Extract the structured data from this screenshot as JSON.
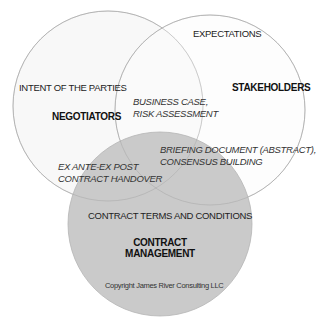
{
  "diagram": {
    "type": "venn",
    "circles": [
      {
        "id": "negotiators",
        "title": "NEGOTIATORS",
        "subtitle": "INTENT OF THE PARTIES",
        "fill": "#f7f7f7",
        "stroke": "#aaaaaa"
      },
      {
        "id": "stakeholders",
        "title": "STAKEHOLDERS",
        "subtitle": "EXPECTATIONS",
        "fill": "#fbfbfb",
        "stroke": "#aaaaaa"
      },
      {
        "id": "contract-management",
        "title_line1": "CONTRACT",
        "title_line2": "MANAGEMENT",
        "subtitle": "CONTRACT TERMS AND CONDITIONS",
        "fill": "#c9c9c9",
        "stroke": "#b0b0b0"
      }
    ],
    "overlaps": {
      "negotiators_stakeholders": {
        "line1": "BUSINESS CASE,",
        "line2": "RISK ASSESSMENT"
      },
      "stakeholders_contract": {
        "line1": "BRIEFING DOCUMENT (ABSTRACT),",
        "line2": "CONSENSUS BUILDING"
      },
      "negotiators_contract": {
        "line1": "EX ANTE-EX POST",
        "line2": "CONTRACT HANDOVER"
      }
    },
    "copyright": "Copyright James River Consulting LLC"
  }
}
